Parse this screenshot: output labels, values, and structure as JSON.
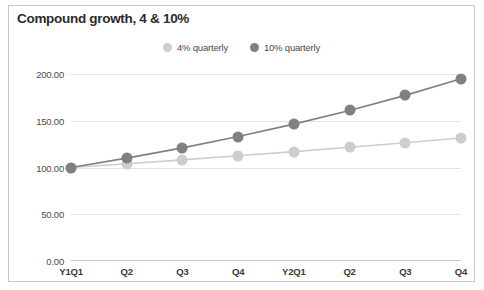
{
  "chart_data": {
    "type": "line",
    "title": "Compound growth, 4 & 10%",
    "xlabel": "",
    "ylabel": "",
    "categories": [
      "Y1Q1",
      "Q2",
      "Q3",
      "Q4",
      "Y2Q1",
      "Q2",
      "Q3",
      "Q4"
    ],
    "series": [
      {
        "name": "4% quarterly",
        "color": "#cdcdcd",
        "values": [
          100.0,
          104.0,
          108.16,
          112.49,
          116.99,
          121.67,
          126.53,
          131.59
        ]
      },
      {
        "name": "10% quarterly",
        "color": "#808080",
        "values": [
          100.0,
          110.0,
          121.0,
          133.1,
          146.41,
          161.05,
          177.16,
          194.87
        ]
      }
    ],
    "ylim": [
      0,
      200
    ],
    "yticks": [
      0,
      50,
      100,
      150,
      200
    ],
    "ytick_labels": [
      "0.00",
      "50.00",
      "100.00",
      "150.00",
      "200.00"
    ],
    "grid": true,
    "legend_position": "top-center"
  },
  "colors": {
    "series_light": "#cdcdcd",
    "series_dark": "#808080",
    "gridline": "#e2e2e2",
    "axis": "#c9c9c9",
    "title_text": "#2b2b2b",
    "tick_text": "#4a4a4a",
    "border": "#c9c9c9",
    "background": "#ffffff"
  }
}
